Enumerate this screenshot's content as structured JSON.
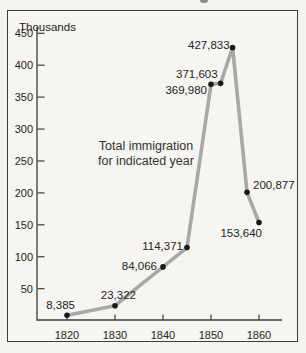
{
  "chart_data": {
    "type": "line",
    "y_axis_unit_label": "Thousands",
    "annotation_lines": [
      "Total immigration",
      "for indicated year"
    ],
    "x_tick_labels": [
      "1820",
      "1830",
      "1840",
      "1850",
      "1860"
    ],
    "x_tick_years": [
      1820,
      1830,
      1840,
      1850,
      1860
    ],
    "y_tick_values": [
      50,
      100,
      150,
      200,
      250,
      300,
      350,
      400,
      450
    ],
    "y_tick_labels": [
      "50",
      "100",
      "150",
      "200",
      "250",
      "300",
      "350",
      "400",
      "450"
    ],
    "xlim_years": [
      1814,
      1865
    ],
    "ylim_thousands": [
      0,
      460
    ],
    "grid": "off",
    "legend": "none",
    "colors": {
      "line": "#a8a8a8",
      "point": "#1a1a1a",
      "axis": "#3b3b3b",
      "text": "#242424",
      "annotation_text": "#333333",
      "background": "#f4f3ef"
    },
    "points": [
      {
        "x": 1820,
        "value": 8385,
        "label": "8,385",
        "anchor": "end",
        "dx": 8,
        "dy": -6
      },
      {
        "x": 1830,
        "value": 23322,
        "label": "23,322",
        "anchor": "end",
        "dx": 21,
        "dy": -7
      },
      {
        "x": 1840,
        "value": 84066,
        "label": "84,066",
        "anchor": "end",
        "dx": -6,
        "dy": 3
      },
      {
        "x": 1845,
        "value": 114371,
        "label": "114,371",
        "anchor": "end",
        "dx": -4,
        "dy": 2
      },
      {
        "x": 1850,
        "value": 369980,
        "label": "369,980",
        "anchor": "end",
        "dx": -4,
        "dy": 10
      },
      {
        "x": 1852,
        "value": 371603,
        "label": "371,603",
        "anchor": "end",
        "dx": -3,
        "dy": -5
      },
      {
        "x": 1854.5,
        "value": 427833,
        "label": "427,833",
        "anchor": "end",
        "dx": -3,
        "dy": 2
      },
      {
        "x": 1857.5,
        "value": 200877,
        "label": "200,877",
        "anchor": "start",
        "dx": 6,
        "dy": -3
      },
      {
        "x": 1860,
        "value": 153640,
        "label": "153,640",
        "anchor": "end",
        "dx": 3,
        "dy": 14
      }
    ]
  }
}
